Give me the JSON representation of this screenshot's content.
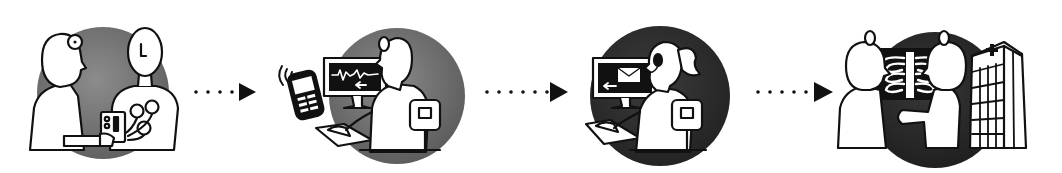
{
  "diagram": {
    "type": "process-flow",
    "direction": "left-to-right",
    "background": "#ffffff",
    "line_color": "#111111",
    "figure_fill": "#ffffff",
    "steps": [
      {
        "id": "step-1",
        "subject": "patient-ecg-recording",
        "icons": [
          "doctor-icon",
          "patient-icon",
          "ecg-electrodes-icon",
          "ecg-recorder-device-icon"
        ],
        "circle": {
          "cx": 103,
          "cy": 93,
          "r": 66,
          "color": "#6e6e6e",
          "color_light": "#8c8c8c"
        }
      },
      {
        "id": "step-2",
        "subject": "wireless-ecg-transmission",
        "icons": [
          "mobile-phone-icon",
          "wireless-signal-icon",
          "monitor-ecg-waveform-icon",
          "operator-icon",
          "chair-icon"
        ],
        "circle": {
          "cx": 397,
          "cy": 96,
          "r": 68,
          "color": "#6a6a6a",
          "color_light": "#8a8a8a"
        }
      },
      {
        "id": "step-3",
        "subject": "call-center-operator-email",
        "icons": [
          "monitor-email-icon",
          "headset-operator-icon",
          "chair-icon"
        ],
        "circle": {
          "cx": 660,
          "cy": 96,
          "r": 70,
          "color": "#2e2e2e",
          "color_light": "#3c3c3c"
        }
      },
      {
        "id": "step-4",
        "subject": "doctors-reviewing-xray-at-hospital",
        "icons": [
          "doctor-icon",
          "chest-xray-icon",
          "doctor-icon",
          "hospital-building-icon",
          "red-cross-icon"
        ],
        "circle": {
          "cx": 935,
          "cy": 100,
          "r": 68,
          "color": "#2a2a2a",
          "color_light": "#383838"
        }
      }
    ],
    "connectors": [
      {
        "from": "step-1",
        "to": "step-2",
        "style": "dotted-arrow",
        "dots": 4,
        "x_start": 196,
        "x_end": 256,
        "y": 92
      },
      {
        "from": "step-2",
        "to": "step-3",
        "style": "dotted-arrow",
        "dots": 6,
        "x_start": 485,
        "x_end": 568,
        "y": 92
      },
      {
        "from": "step-3",
        "to": "step-4",
        "style": "dotted-arrow",
        "dots": 5,
        "x_start": 757,
        "x_end": 833,
        "y": 92
      }
    ]
  }
}
